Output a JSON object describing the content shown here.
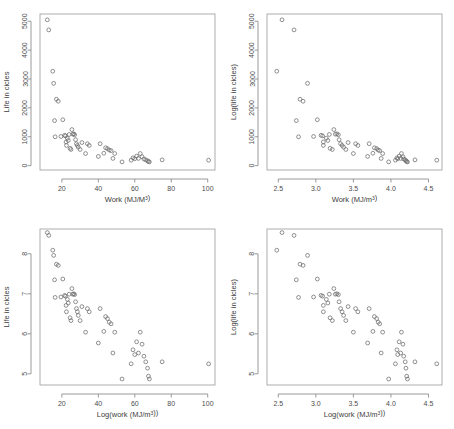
{
  "figure": {
    "title": "",
    "layout": "2x2 grid of scatter plots",
    "background": "#ffffff",
    "point_color": "#6b6b6b",
    "frame_color": "#9a9a9a",
    "text_color": "#4d4d4d"
  },
  "chart_data": [
    {
      "id": "top-left",
      "type": "scatter",
      "title": "",
      "xlabel": "Work (MJ/M³)",
      "ylabel": "Life in cicles",
      "xlim": [
        8,
        104
      ],
      "ylim": [
        -150,
        5250
      ],
      "xticks": [
        20,
        40,
        60,
        80,
        100
      ],
      "yticks": [
        0,
        1000,
        2000,
        3000,
        4000,
        5000
      ],
      "xtick_labels": [
        "20",
        "40",
        "60",
        "80",
        "100"
      ],
      "ytick_labels": [
        "0",
        "1000",
        "2000",
        "3000",
        "4000",
        "5000"
      ],
      "grid": false,
      "legend": "none",
      "x": [
        12.0,
        12.8,
        15.0,
        15.5,
        16.0,
        16.3,
        17.0,
        18.0,
        19.5,
        20.5,
        21.5,
        22.0,
        22.3,
        22.5,
        23.0,
        23.5,
        24.0,
        24.5,
        25.0,
        25.5,
        26.0,
        26.5,
        27.0,
        27.5,
        28.0,
        28.5,
        29.0,
        30.0,
        31.0,
        33.0,
        34.0,
        35.0,
        40.0,
        41.0,
        43.0,
        44.0,
        45.0,
        46.0,
        47.0,
        48.0,
        49.0,
        53.0,
        58.0,
        59.0,
        60.0,
        61.0,
        62.0,
        63.0,
        64.0,
        65.0,
        66.0,
        67.0,
        67.5,
        68.0,
        75.0,
        100.5
      ],
      "y": [
        5050,
        4700,
        3270,
        2850,
        1560,
        1000,
        2300,
        2230,
        1010,
        1590,
        1050,
        1030,
        820,
        700,
        950,
        870,
        1080,
        600,
        560,
        1250,
        1090,
        1100,
        1070,
        900,
        760,
        700,
        640,
        560,
        800,
        420,
        760,
        700,
        320,
        760,
        430,
        620,
        590,
        540,
        520,
        250,
        420,
        130,
        190,
        270,
        240,
        330,
        250,
        420,
        310,
        230,
        200,
        170,
        140,
        130,
        200,
        190
      ]
    },
    {
      "id": "top-right",
      "type": "scatter",
      "title": "",
      "xlabel": "Work (MJ/m³)",
      "ylabel": "Log(life in cicles)",
      "xlim": [
        2.35,
        4.68
      ],
      "ylim": [
        -150,
        5250
      ],
      "xticks": [
        2.5,
        3.0,
        3.5,
        4.0,
        4.5
      ],
      "yticks": [
        0,
        1000,
        2000,
        3000,
        4000,
        5000
      ],
      "xtick_labels": [
        "2.5",
        "3.0",
        "3.5",
        "4.0",
        "4.5"
      ],
      "ytick_labels": [
        "0",
        "1000",
        "2000",
        "3000",
        "4000",
        "5000"
      ],
      "grid": false,
      "legend": "none",
      "x": [
        2.48,
        2.55,
        2.71,
        2.74,
        2.77,
        2.79,
        2.83,
        2.89,
        2.97,
        3.02,
        3.07,
        3.09,
        3.1,
        3.1,
        3.14,
        3.16,
        3.18,
        3.19,
        3.22,
        3.24,
        3.26,
        3.28,
        3.3,
        3.31,
        3.33,
        3.35,
        3.37,
        3.4,
        3.43,
        3.5,
        3.53,
        3.56,
        3.69,
        3.71,
        3.76,
        3.78,
        3.81,
        3.83,
        3.85,
        3.87,
        3.89,
        3.97,
        4.06,
        4.08,
        4.09,
        4.11,
        4.13,
        4.14,
        4.16,
        4.17,
        4.19,
        4.2,
        4.21,
        4.22,
        4.32,
        4.61
      ],
      "y": [
        3270,
        5050,
        4700,
        1560,
        1000,
        2300,
        2230,
        2850,
        1010,
        1590,
        1050,
        1030,
        820,
        700,
        950,
        870,
        1080,
        600,
        560,
        1250,
        1090,
        1100,
        1070,
        900,
        760,
        700,
        640,
        560,
        800,
        420,
        760,
        700,
        320,
        760,
        430,
        620,
        590,
        540,
        520,
        250,
        420,
        130,
        190,
        270,
        240,
        330,
        250,
        420,
        310,
        230,
        200,
        170,
        140,
        130,
        200,
        190
      ]
    },
    {
      "id": "bottom-left",
      "type": "scatter",
      "title": "",
      "xlabel": "Log(work (MJ/m³))",
      "ylabel": "Life in cicles",
      "xlim": [
        8,
        104
      ],
      "ylim": [
        4.72,
        8.62
      ],
      "xticks": [
        20,
        40,
        60,
        80,
        100
      ],
      "yticks": [
        5,
        6,
        7,
        8
      ],
      "xtick_labels": [
        "20",
        "40",
        "60",
        "80",
        "100"
      ],
      "ytick_labels": [
        "5",
        "6",
        "7",
        "8"
      ],
      "grid": false,
      "legend": "none",
      "x": [
        12.0,
        12.8,
        15.0,
        15.5,
        16.0,
        16.3,
        17.0,
        18.0,
        19.5,
        20.5,
        21.5,
        22.0,
        22.3,
        22.5,
        23.0,
        23.5,
        24.0,
        24.5,
        25.0,
        25.5,
        26.0,
        26.5,
        27.0,
        27.5,
        28.0,
        28.5,
        29.0,
        30.0,
        31.0,
        33.0,
        34.0,
        35.0,
        40.0,
        41.0,
        43.0,
        44.0,
        45.0,
        46.0,
        47.0,
        48.0,
        49.0,
        53.0,
        58.0,
        59.0,
        60.0,
        61.0,
        62.0,
        63.0,
        64.0,
        65.0,
        66.0,
        67.0,
        67.5,
        68.0,
        75.0,
        100.5
      ],
      "y": [
        8.53,
        8.46,
        8.09,
        7.96,
        7.35,
        6.91,
        7.74,
        7.71,
        6.92,
        7.37,
        6.96,
        6.94,
        6.71,
        6.55,
        6.86,
        6.77,
        6.99,
        6.4,
        6.33,
        7.13,
        6.99,
        7.0,
        6.98,
        6.8,
        6.63,
        6.55,
        6.46,
        6.33,
        6.68,
        6.04,
        6.63,
        6.55,
        5.77,
        6.63,
        6.06,
        6.43,
        6.38,
        6.29,
        6.25,
        5.52,
        6.04,
        4.87,
        5.25,
        5.6,
        5.48,
        5.8,
        5.52,
        6.04,
        5.74,
        5.44,
        5.3,
        5.14,
        4.94,
        4.87,
        5.3,
        5.25
      ]
    },
    {
      "id": "bottom-right",
      "type": "scatter",
      "title": "",
      "xlabel": "Log(work (MJ/m³))",
      "ylabel": "Log(life in cicles)",
      "xlim": [
        2.35,
        4.68
      ],
      "ylim": [
        4.72,
        8.62
      ],
      "xticks": [
        2.5,
        3.0,
        3.5,
        4.0,
        4.5
      ],
      "yticks": [
        5,
        6,
        7,
        8
      ],
      "xtick_labels": [
        "2.5",
        "3.0",
        "3.5",
        "4.0",
        "4.5"
      ],
      "ytick_labels": [
        "5",
        "6",
        "7",
        "8"
      ],
      "grid": false,
      "legend": "none",
      "x": [
        2.48,
        2.55,
        2.71,
        2.74,
        2.77,
        2.79,
        2.83,
        2.89,
        2.97,
        3.02,
        3.07,
        3.09,
        3.1,
        3.1,
        3.14,
        3.16,
        3.18,
        3.19,
        3.22,
        3.24,
        3.26,
        3.28,
        3.3,
        3.31,
        3.33,
        3.35,
        3.37,
        3.4,
        3.43,
        3.5,
        3.53,
        3.56,
        3.69,
        3.71,
        3.76,
        3.78,
        3.81,
        3.83,
        3.85,
        3.87,
        3.89,
        3.97,
        4.06,
        4.08,
        4.09,
        4.11,
        4.13,
        4.14,
        4.16,
        4.17,
        4.19,
        4.2,
        4.21,
        4.22,
        4.32,
        4.61
      ],
      "y": [
        8.09,
        8.53,
        8.46,
        7.35,
        6.91,
        7.74,
        7.71,
        7.96,
        6.92,
        7.37,
        6.96,
        6.94,
        6.71,
        6.55,
        6.86,
        6.77,
        6.99,
        6.4,
        6.33,
        7.13,
        6.99,
        7.0,
        6.98,
        6.8,
        6.63,
        6.55,
        6.46,
        6.33,
        6.68,
        6.04,
        6.63,
        6.55,
        5.77,
        6.63,
        6.06,
        6.43,
        6.38,
        6.29,
        6.25,
        5.52,
        6.04,
        4.87,
        5.25,
        5.6,
        5.48,
        5.8,
        5.52,
        6.04,
        5.74,
        5.44,
        5.3,
        5.14,
        4.94,
        4.87,
        5.3,
        5.25
      ]
    }
  ]
}
